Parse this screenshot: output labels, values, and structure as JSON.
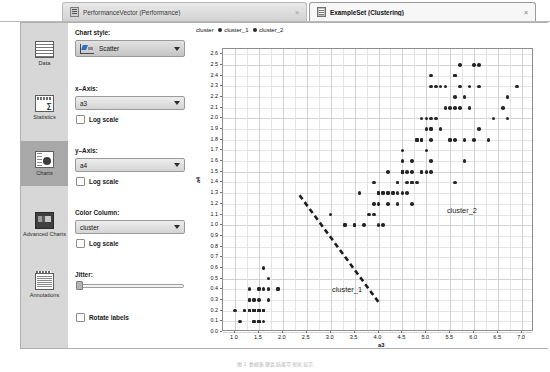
{
  "tabs": [
    {
      "label": "PerformanceVector (Performance)",
      "icon": "document-icon",
      "active": false,
      "close": "×"
    },
    {
      "label": "ExampleSet (Clustering)",
      "icon": "grid-icon",
      "active": true,
      "close": "×"
    }
  ],
  "sidebar": {
    "items": [
      {
        "label": "Data",
        "icon": "table-icon",
        "selected": false
      },
      {
        "label": "Statistics",
        "icon": "sigma-icon",
        "selected": false
      },
      {
        "label": "Charts",
        "icon": "chart-icon",
        "selected": true
      },
      {
        "label": "Advanced Charts",
        "icon": "advanced-chart-icon",
        "selected": false
      },
      {
        "label": "Annotations",
        "icon": "annotations-icon",
        "selected": false
      }
    ]
  },
  "options": {
    "chart_style_label": "Chart style:",
    "chart_style_value": "Scatter",
    "x_axis_label": "x–Axis:",
    "x_axis_value": "a3",
    "x_log_label": "Log scale",
    "y_axis_label": "y–Axis:",
    "y_axis_value": "a4",
    "y_log_label": "Log scale",
    "color_column_label": "Color Column:",
    "color_column_value": "cluster",
    "color_log_label": "Log scale",
    "jitter_label": "Jitter:",
    "jitter_value": "0",
    "rotate_labels_label": "Rotate labels"
  },
  "chart_data": {
    "type": "scatter",
    "title": "",
    "xlabel": "a3",
    "ylabel": "a4",
    "xlim": [
      0.75,
      7.25
    ],
    "ylim": [
      0.0,
      2.65
    ],
    "grid": true,
    "legend_title": "cluster",
    "legend_position": "top-left",
    "xticks": [
      1.0,
      1.5,
      2.0,
      2.5,
      3.0,
      3.5,
      4.0,
      4.5,
      5.0,
      5.5,
      6.0,
      6.5,
      7.0
    ],
    "xtick_labels": [
      "1.0",
      "1.5",
      "2.0",
      "2.5",
      "3.0",
      "3.5",
      "4.0",
      "4.5",
      "5.0",
      "5.5",
      "6.0",
      "6.5",
      "7.0"
    ],
    "yticks": [
      0.0,
      0.1,
      0.2,
      0.3,
      0.4,
      0.5,
      0.6,
      0.7,
      0.8,
      0.9,
      1.0,
      1.1,
      1.2,
      1.3,
      1.4,
      1.5,
      1.6,
      1.7,
      1.8,
      1.9,
      2.0,
      2.1,
      2.2,
      2.3,
      2.4,
      2.5,
      2.6
    ],
    "ytick_labels": [
      "0.0",
      "0.1",
      "0.2",
      "0.3",
      "0.4",
      "0.5",
      "0.6",
      "0.7",
      "0.8",
      "0.9",
      "1.0",
      "1.1",
      "1.2",
      "1.3",
      "1.4",
      "1.5",
      "1.6",
      "1.7",
      "1.8",
      "1.9",
      "2.0",
      "2.1",
      "2.2",
      "2.3",
      "2.4",
      "2.5",
      "2.6"
    ],
    "annotations": [
      {
        "text": "cluster_1",
        "x": 3.05,
        "y": 0.38
      },
      {
        "text": "cluster_2",
        "x": 5.45,
        "y": 1.12
      }
    ],
    "separator_line": {
      "style": "dashed",
      "x0": 2.35,
      "y0": 1.28,
      "x1": 4.0,
      "y1": 0.28
    },
    "series": [
      {
        "name": "cluster_1",
        "color": "#262626",
        "points": [
          [
            1.4,
            0.2
          ],
          [
            1.5,
            0.2
          ],
          [
            1.3,
            0.2
          ],
          [
            1.6,
            0.2
          ],
          [
            1.4,
            0.1
          ],
          [
            1.5,
            0.1
          ],
          [
            1.1,
            0.1
          ],
          [
            1.2,
            0.2
          ],
          [
            1.7,
            0.4
          ],
          [
            1.5,
            0.4
          ],
          [
            1.6,
            0.2
          ],
          [
            1.4,
            0.3
          ],
          [
            1.5,
            0.3
          ],
          [
            1.3,
            0.4
          ],
          [
            1.7,
            0.3
          ],
          [
            1.5,
            0.2
          ],
          [
            1.0,
            0.2
          ],
          [
            1.7,
            0.5
          ],
          [
            1.9,
            0.4
          ],
          [
            1.6,
            0.2
          ],
          [
            1.6,
            0.4
          ],
          [
            1.5,
            0.1
          ],
          [
            1.4,
            0.2
          ],
          [
            1.6,
            0.2
          ],
          [
            1.6,
            0.1
          ],
          [
            1.5,
            0.2
          ],
          [
            1.4,
            0.2
          ],
          [
            1.5,
            0.4
          ],
          [
            1.2,
            0.2
          ],
          [
            1.3,
            0.2
          ],
          [
            1.4,
            0.1
          ],
          [
            1.3,
            0.2
          ],
          [
            1.5,
            0.1
          ],
          [
            1.3,
            0.3
          ],
          [
            1.3,
            0.3
          ],
          [
            1.3,
            0.2
          ],
          [
            1.6,
            0.6
          ],
          [
            1.9,
            0.4
          ],
          [
            1.4,
            0.3
          ],
          [
            1.6,
            0.2
          ],
          [
            1.4,
            0.2
          ],
          [
            1.5,
            0.2
          ],
          [
            1.4,
            0.2
          ],
          [
            1.5,
            0.2
          ],
          [
            1.4,
            0.2
          ]
        ]
      },
      {
        "name": "cluster_2",
        "color": "#262626",
        "points": [
          [
            4.7,
            1.4
          ],
          [
            4.5,
            1.5
          ],
          [
            4.9,
            1.5
          ],
          [
            4.0,
            1.3
          ],
          [
            4.6,
            1.5
          ],
          [
            4.5,
            1.3
          ],
          [
            4.7,
            1.6
          ],
          [
            3.3,
            1.0
          ],
          [
            4.6,
            1.3
          ],
          [
            3.9,
            1.4
          ],
          [
            3.5,
            1.0
          ],
          [
            4.2,
            1.5
          ],
          [
            4.0,
            1.0
          ],
          [
            4.7,
            1.4
          ],
          [
            3.6,
            1.3
          ],
          [
            4.4,
            1.4
          ],
          [
            4.5,
            1.5
          ],
          [
            4.1,
            1.0
          ],
          [
            4.5,
            1.5
          ],
          [
            3.9,
            1.1
          ],
          [
            4.8,
            1.8
          ],
          [
            4.0,
            1.3
          ],
          [
            4.9,
            1.5
          ],
          [
            4.7,
            1.2
          ],
          [
            4.3,
            1.3
          ],
          [
            4.4,
            1.4
          ],
          [
            4.8,
            1.4
          ],
          [
            5.0,
            1.7
          ],
          [
            4.5,
            1.5
          ],
          [
            3.5,
            1.0
          ],
          [
            3.8,
            1.1
          ],
          [
            3.7,
            1.0
          ],
          [
            3.9,
            1.2
          ],
          [
            5.1,
            1.6
          ],
          [
            4.5,
            1.5
          ],
          [
            4.5,
            1.6
          ],
          [
            4.7,
            1.5
          ],
          [
            4.4,
            1.3
          ],
          [
            4.1,
            1.3
          ],
          [
            4.0,
            1.3
          ],
          [
            4.4,
            1.2
          ],
          [
            4.6,
            1.4
          ],
          [
            4.0,
            1.2
          ],
          [
            3.3,
            1.0
          ],
          [
            4.2,
            1.3
          ],
          [
            4.2,
            1.2
          ],
          [
            4.2,
            1.3
          ],
          [
            4.3,
            1.3
          ],
          [
            3.0,
            1.1
          ],
          [
            4.1,
            1.3
          ],
          [
            6.0,
            2.5
          ],
          [
            5.1,
            1.9
          ],
          [
            5.9,
            2.1
          ],
          [
            5.6,
            1.8
          ],
          [
            5.8,
            2.2
          ],
          [
            6.6,
            2.1
          ],
          [
            4.5,
            1.7
          ],
          [
            6.3,
            1.8
          ],
          [
            5.8,
            1.8
          ],
          [
            6.1,
            2.5
          ],
          [
            5.1,
            2.0
          ],
          [
            5.3,
            1.9
          ],
          [
            5.5,
            2.1
          ],
          [
            5.0,
            2.0
          ],
          [
            5.1,
            2.4
          ],
          [
            5.3,
            2.3
          ],
          [
            5.5,
            1.8
          ],
          [
            6.7,
            2.2
          ],
          [
            6.9,
            2.3
          ],
          [
            5.0,
            1.5
          ],
          [
            5.7,
            2.3
          ],
          [
            4.9,
            2.0
          ],
          [
            6.7,
            2.0
          ],
          [
            4.9,
            1.8
          ],
          [
            5.7,
            2.1
          ],
          [
            6.0,
            1.8
          ],
          [
            4.8,
            1.8
          ],
          [
            4.9,
            1.8
          ],
          [
            5.6,
            2.1
          ],
          [
            5.8,
            1.6
          ],
          [
            6.1,
            1.9
          ],
          [
            6.4,
            2.0
          ],
          [
            5.6,
            2.2
          ],
          [
            5.1,
            1.5
          ],
          [
            5.6,
            1.4
          ],
          [
            6.1,
            2.3
          ],
          [
            5.6,
            2.4
          ],
          [
            5.5,
            1.8
          ],
          [
            4.8,
            1.8
          ],
          [
            5.4,
            2.1
          ],
          [
            5.6,
            2.4
          ],
          [
            5.1,
            2.3
          ],
          [
            5.1,
            1.9
          ],
          [
            5.9,
            2.3
          ],
          [
            5.7,
            2.5
          ],
          [
            5.2,
            2.3
          ],
          [
            5.0,
            1.9
          ],
          [
            5.2,
            2.0
          ],
          [
            5.4,
            2.3
          ],
          [
            5.1,
            1.8
          ]
        ]
      }
    ]
  },
  "caption": "图 1  数据集聚类结果可视化显示"
}
